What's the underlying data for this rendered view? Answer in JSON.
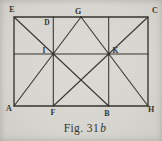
{
  "figure": {
    "caption": {
      "prefix": "Fig. 31",
      "suffix": "b"
    },
    "vertex_labels": {
      "E": "E",
      "D": "D",
      "G": "G",
      "C": "C",
      "A": "A",
      "F": "F",
      "B": "B",
      "H": "H",
      "I": "I",
      "K": "K"
    },
    "colors": {
      "paper": "#d7d5d0",
      "ink": "#35342e"
    }
  }
}
